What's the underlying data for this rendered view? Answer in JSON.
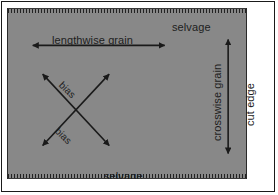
{
  "figure": {
    "fabric_color": "#888888",
    "ink_color": "#1d1d1d",
    "background_color": "#ffffff"
  },
  "labels": {
    "selvage_top": "selvage",
    "selvage_bottom": "selvage",
    "lengthwise_grain": "lengthwise grain",
    "crosswise_grain": "crosswise grain",
    "cut_edge": "cut edge",
    "bias_upper": "bias",
    "bias_lower": "bias"
  },
  "arrows": [
    {
      "name": "lengthwise-grain-arrow",
      "orientation": "horizontal",
      "double_headed": true,
      "x1": 21,
      "y1": 37,
      "x2": 162,
      "y2": 37
    },
    {
      "name": "crosswise-grain-arrow",
      "orientation": "vertical",
      "double_headed": true,
      "x1": 222,
      "y1": 27,
      "x2": 222,
      "y2": 150
    },
    {
      "name": "bias-arrow-ne",
      "orientation": "diagonal-ne",
      "double_headed": true,
      "x1": 31,
      "y1": 62,
      "x2": 106,
      "y2": 142
    },
    {
      "name": "bias-arrow-nw",
      "orientation": "diagonal-nw",
      "double_headed": true,
      "x1": 106,
      "y1": 62,
      "x2": 31,
      "y2": 142
    }
  ]
}
